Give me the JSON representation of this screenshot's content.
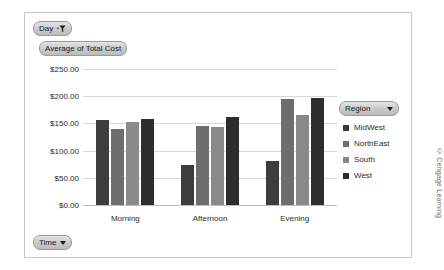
{
  "field_buttons": {
    "day": {
      "label": "Day",
      "icon": "filter-funnel-icon"
    },
    "value": {
      "label": "Average of Total Cost"
    },
    "time": {
      "label": "Time",
      "icon": "chevron-down-icon"
    }
  },
  "legend": {
    "field_label": "Region",
    "icon": "chevron-down-icon",
    "items": [
      {
        "label": "MidWest",
        "color": "#3d3d3d"
      },
      {
        "label": "NorthEast",
        "color": "#6e6e6e"
      },
      {
        "label": "South",
        "color": "#8a8a8a"
      },
      {
        "label": "West",
        "color": "#2e2e2e"
      }
    ]
  },
  "attribution": "© Cengage Learning",
  "chart_data": {
    "type": "bar",
    "title": "Average of Total Cost",
    "xlabel": "",
    "ylabel": "",
    "ylim": [
      0,
      250
    ],
    "ytick_step": 50,
    "grid": true,
    "legend_position": "right",
    "categories": [
      "Morning",
      "Afternoon",
      "Evening"
    ],
    "ytick_labels": [
      "$0.00",
      "$50.00",
      "$100.00",
      "$150.00",
      "$200.00",
      "$250.00"
    ],
    "series": [
      {
        "name": "MidWest",
        "color": "#3d3d3d",
        "values": [
          157,
          73,
          80
        ]
      },
      {
        "name": "NorthEast",
        "color": "#6e6e6e",
        "values": [
          140,
          145,
          195
        ]
      },
      {
        "name": "South",
        "color": "#8a8a8a",
        "values": [
          153,
          143,
          165
        ]
      },
      {
        "name": "West",
        "color": "#2e2e2e",
        "values": [
          159,
          162,
          197
        ]
      }
    ]
  }
}
